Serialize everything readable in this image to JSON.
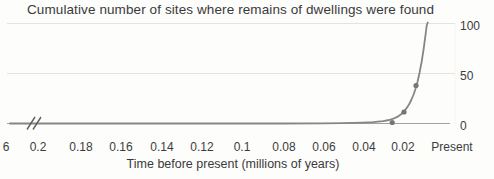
{
  "chart_data": {
    "type": "line",
    "title": "Cumulative number of sites where remains of dwellings were found",
    "xlabel": "Time before present (millions of years)",
    "ylabel": "",
    "x_axis": {
      "tick_labels": [
        "6",
        "0.2",
        "0.18",
        "0.16",
        "0.14",
        "0.12",
        "0.1",
        "0.08",
        "0.06",
        "0.04",
        "0.02",
        "Present"
      ],
      "axis_break_between": [
        "6",
        "0.2"
      ],
      "note": "time before present, decreasing toward the right"
    },
    "y_axis": {
      "tick_labels": [
        "100",
        "50",
        "0"
      ],
      "side": "right",
      "range": [
        0,
        100
      ]
    },
    "grid": "horizontal gridlines at 0, 50, 100",
    "legend": "none",
    "series": [
      {
        "name": "cumulative-sites-curve",
        "points": [
          [
            6,
            0
          ],
          [
            0.2,
            0
          ],
          [
            0.15,
            0
          ],
          [
            0.1,
            0
          ],
          [
            0.08,
            0
          ],
          [
            0.06,
            0.2
          ],
          [
            0.05,
            0.4
          ],
          [
            0.045,
            0.6
          ],
          [
            0.04,
            0.9
          ],
          [
            0.035,
            1.4
          ],
          [
            0.03,
            2.4
          ],
          [
            0.027,
            3.5
          ],
          [
            0.025,
            4.8
          ],
          [
            0.023,
            6.6
          ],
          [
            0.021,
            9.5
          ],
          [
            0.02,
            11.5
          ],
          [
            0.019,
            13.8
          ],
          [
            0.018,
            16.6
          ],
          [
            0.017,
            20
          ],
          [
            0.016,
            24
          ],
          [
            0.015,
            29
          ],
          [
            0.014,
            35
          ],
          [
            0.013,
            42
          ],
          [
            0.012,
            51
          ],
          [
            0.011,
            62
          ],
          [
            0.01,
            75
          ],
          [
            0.009,
            90
          ],
          [
            0.0085,
            98
          ],
          [
            0.008,
            101
          ]
        ],
        "markers": [
          [
            0.0255,
            1
          ],
          [
            0.0197,
            11.5
          ],
          [
            0.0138,
            38
          ]
        ]
      }
    ],
    "colors": {
      "line": "#868686",
      "marker": "#767676",
      "grid": "#e3e3e3",
      "axis": "#a3a3a3",
      "right_axis": "#e6e6e6",
      "text": "#3a3a3a",
      "break_mark": "#5f5f5f"
    }
  }
}
